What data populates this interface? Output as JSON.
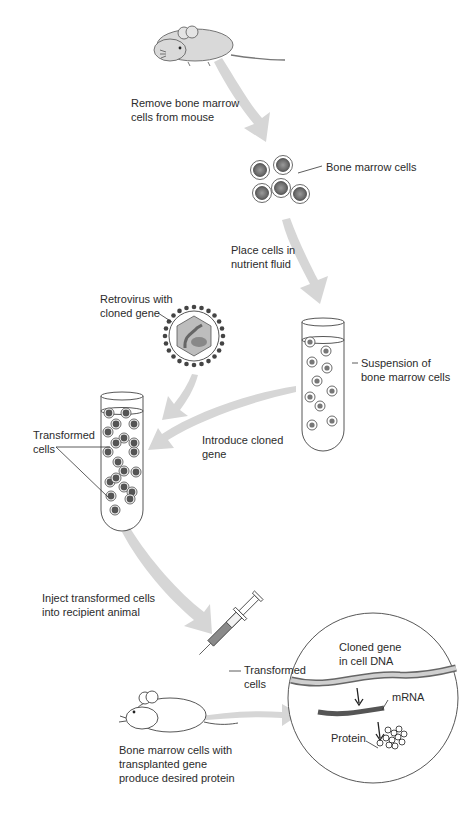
{
  "steps": {
    "remove": "Remove bone marrow\ncells from mouse",
    "bone_marrow_cells": "Bone marrow cells",
    "place": "Place cells in\nnutrient fluid",
    "retrovirus": "Retrovirus with\ncloned gene",
    "suspension": "Suspension of\nbone marrow cells",
    "introduce": "Introduce cloned\ngene",
    "transformed_cells_tube": "Transformed\ncells",
    "inject": "Inject transformed cells\ninto recipient animal",
    "transformed_cells_syringe": "Transformed\ncells",
    "result": "Bone marrow cells with\ntransplanted gene\nproduce desired protein"
  },
  "inset": {
    "cloned_gene": "Cloned gene\nin cell DNA",
    "mrna": "mRNA",
    "protein": "Protein"
  },
  "colors": {
    "arrow": "#d4d4d4",
    "outline": "#3a3a3a",
    "cell_fill": "#7a7a7a",
    "mrna": "#555555"
  }
}
